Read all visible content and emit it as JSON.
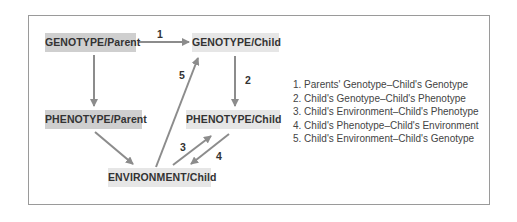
{
  "nodes": {
    "genotype_parent": "GENOTYPE/Parent",
    "genotype_child": "GENOTYPE/Child",
    "phenotype_parent": "PHENOTYPE/Parent",
    "phenotype_child": "PHENOTYPE/Child",
    "environment_child": "ENVIRONMENT/Child"
  },
  "arrow_labels": {
    "a1": "1",
    "a2": "2",
    "a3": "3",
    "a4": "4",
    "a5": "5"
  },
  "legend": [
    "1. Parents' Genotype–Child's Genotype",
    "2. Child's Genotype–Child's Phenotype",
    "3. Child's Environment–Child's Phenotype",
    "4. Child's Phenotype–Child's Environment",
    "5. Child's Environment–Child's Genotype"
  ],
  "colors": {
    "arrow": "#8c8c8c",
    "node_dark": "#cfcfcf",
    "node_light": "#e6e6e6",
    "border": "#9a9a9a"
  }
}
